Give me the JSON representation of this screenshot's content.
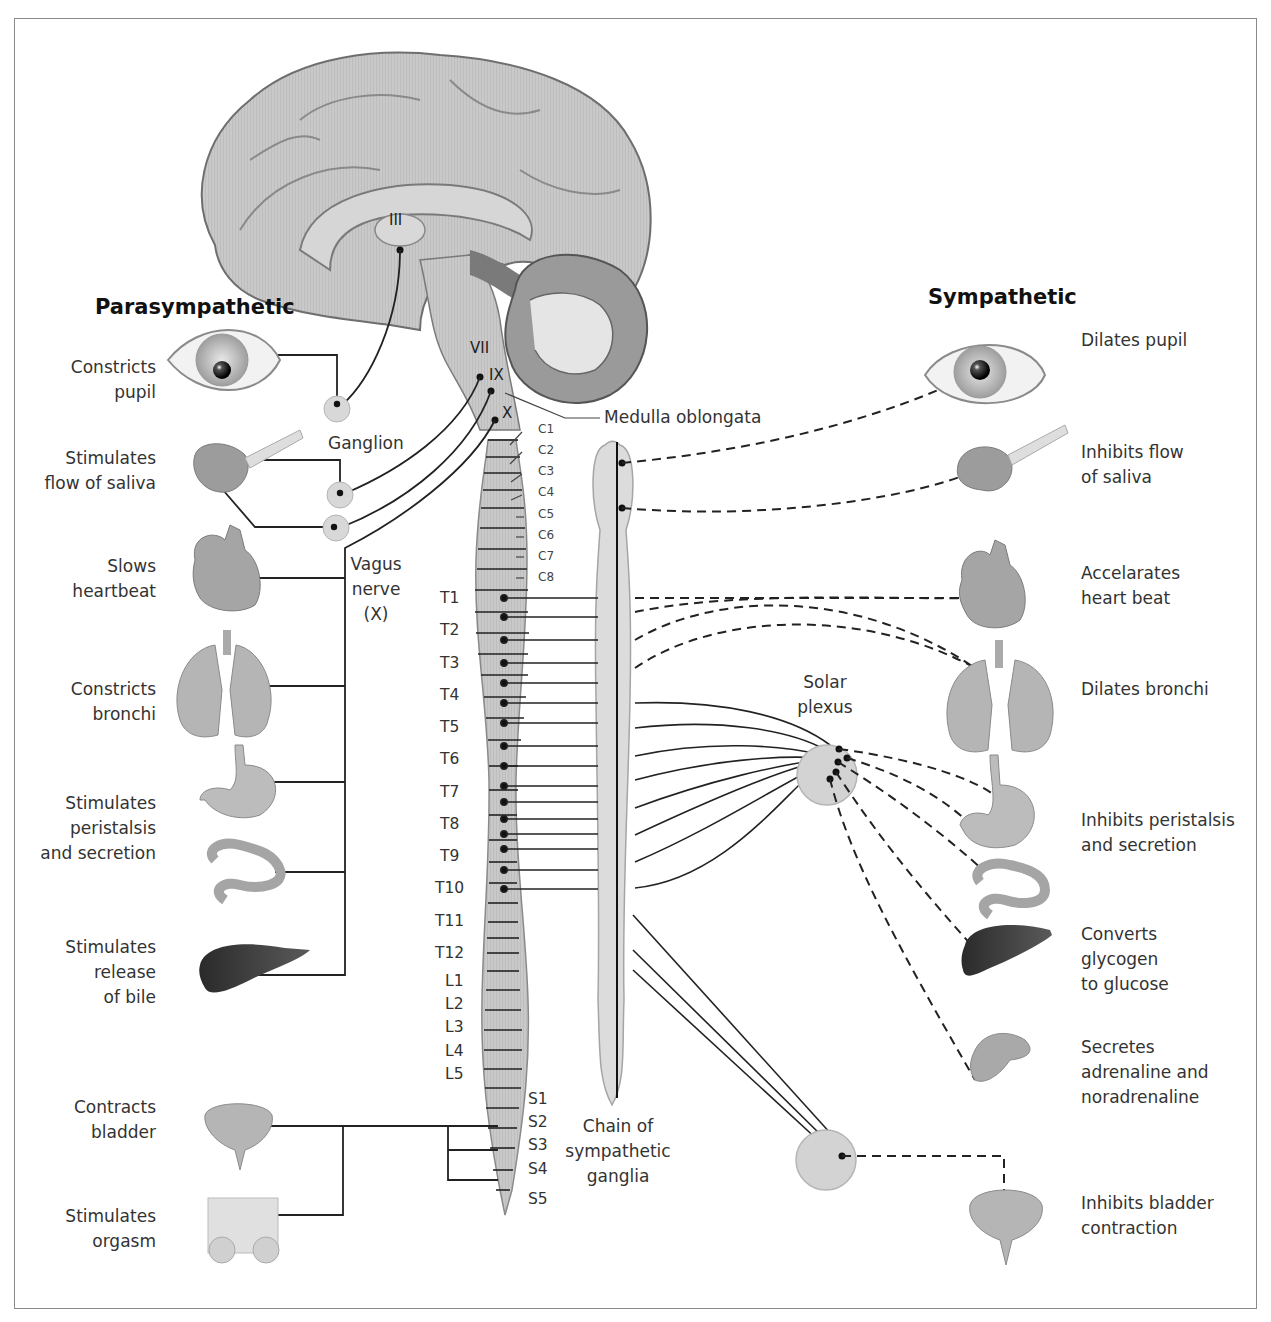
{
  "headings": {
    "parasympathetic": "Parasympathetic",
    "sympathetic": "Sympathetic"
  },
  "parasympathetic_effects": [
    {
      "organ": "eye",
      "text": "Constricts\npupil"
    },
    {
      "organ": "salivary-gland",
      "text": "Stimulates\nflow of saliva"
    },
    {
      "organ": "heart",
      "text": "Slows\nheartbeat"
    },
    {
      "organ": "lungs",
      "text": "Constricts\nbronchi"
    },
    {
      "organ": "stomach-intestine",
      "text": "Stimulates\nperistalsis\nand secretion"
    },
    {
      "organ": "liver",
      "text": "Stimulates\nrelease\nof bile"
    },
    {
      "organ": "bladder",
      "text": "Contracts\nbladder"
    },
    {
      "organ": "genitals",
      "text": "Stimulates\norgasm"
    }
  ],
  "sympathetic_effects": [
    {
      "organ": "eye",
      "text": "Dilates pupil"
    },
    {
      "organ": "salivary-gland",
      "text": "Inhibits flow\nof saliva"
    },
    {
      "organ": "heart",
      "text": "Accelarates\nheart beat"
    },
    {
      "organ": "lungs",
      "text": "Dilates bronchi"
    },
    {
      "organ": "stomach-intestine",
      "text": "Inhibits peristalsis\nand secretion"
    },
    {
      "organ": "liver",
      "text": "Converts\nglycogen\nto glucose"
    },
    {
      "organ": "adrenal",
      "text": "Secretes\nadrenaline and\nnoradrenaline"
    },
    {
      "organ": "bladder",
      "text": "Inhibits bladder\ncontraction"
    }
  ],
  "structures": {
    "ganglion": "Ganglion",
    "vagus_nerve": "Vagus\nnerve\n(X)",
    "medulla": "Medulla oblongata",
    "solar_plexus": "Solar\nplexus",
    "chain": "Chain of\nsympathetic\nganglia"
  },
  "cranial_nerves": [
    "III",
    "VII",
    "IX",
    "X"
  ],
  "cervical_segments": [
    "C1",
    "C2",
    "C3",
    "C4",
    "C5",
    "C6",
    "C7",
    "C8"
  ],
  "thoracic_segments": [
    "T1",
    "T2",
    "T3",
    "T4",
    "T5",
    "T6",
    "T7",
    "T8",
    "T9",
    "T10",
    "T11",
    "T12"
  ],
  "lumbar_segments": [
    "L1",
    "L2",
    "L3",
    "L4",
    "L5"
  ],
  "sacral_segments": [
    "S1",
    "S2",
    "S3",
    "S4",
    "S5"
  ],
  "legend": {
    "solid_line": "preganglionic / parasympathetic fibre",
    "dashed_line": "postganglionic sympathetic fibre"
  }
}
